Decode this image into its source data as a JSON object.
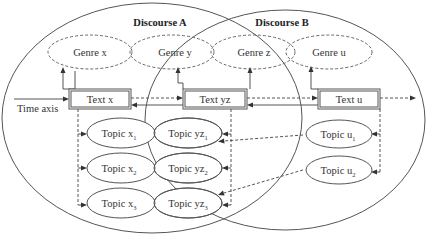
{
  "discourses": [
    {
      "id": "A",
      "label": "Discourse A"
    },
    {
      "id": "B",
      "label": "Discourse B"
    }
  ],
  "genres": [
    {
      "id": "x",
      "label": "Genre x"
    },
    {
      "id": "y",
      "label": "Genre y"
    },
    {
      "id": "z",
      "label": "Genre z"
    },
    {
      "id": "u",
      "label": "Genre u"
    }
  ],
  "texts": [
    {
      "id": "x",
      "label": "Text x"
    },
    {
      "id": "yz",
      "label": "Text yz"
    },
    {
      "id": "u",
      "label": "Text u"
    }
  ],
  "time_axis": {
    "label": "Time axis"
  },
  "topics": {
    "x": [
      {
        "base": "Topic x",
        "sub": "1"
      },
      {
        "base": "Topic x",
        "sub": "2"
      },
      {
        "base": "Topic x",
        "sub": "3"
      }
    ],
    "yz": [
      {
        "base": "Topic yz",
        "sub": "1"
      },
      {
        "base": "Topic yz",
        "sub": "2"
      },
      {
        "base": "Topic yz",
        "sub": "3"
      }
    ],
    "u": [
      {
        "base": "Topic u",
        "sub": "1"
      },
      {
        "base": "Topic u",
        "sub": "2"
      }
    ]
  },
  "colors": {
    "line": "#555555",
    "text": "#333333",
    "background": "#ffffff"
  }
}
